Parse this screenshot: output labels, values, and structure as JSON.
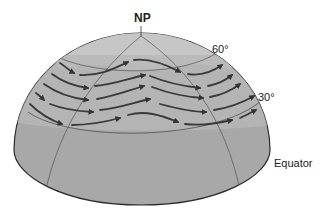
{
  "diagram": {
    "labels": {
      "north_pole": "NP",
      "lat_60": "60°",
      "lat_30": "30°",
      "equator": "Equator"
    },
    "colors": {
      "globe_fill": "#a9a9a9",
      "polar_cap_fill": "#c2c2c2",
      "band_fill": "#b4b4b4",
      "outline": "#2a2a2a",
      "grid_line": "#555555",
      "arrow": "#3a3a3a"
    },
    "flow_direction": "west-to-east",
    "arrow_rows": 5
  }
}
